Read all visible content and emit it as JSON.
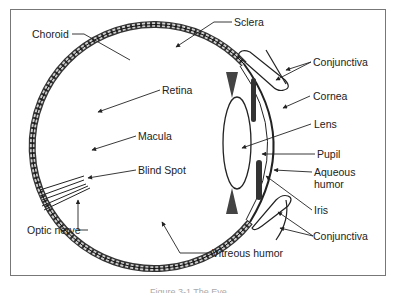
{
  "diagram": {
    "labels": {
      "choroid": "Choroid",
      "sclera": "Sclera",
      "retina": "Retina",
      "macula": "Macula",
      "blind_spot": "Blind Spot",
      "optic_nerve": "Optic nerve",
      "vitreous_humor": "Vitreous humor",
      "conjunctiva_top": "Conjunctiva",
      "cornea": "Cornea",
      "lens": "Lens",
      "pupil": "Pupil",
      "aqueous_humor_1": "Aqueous",
      "aqueous_humor_2": "humor",
      "iris": "Iris",
      "conjunctiva_bottom": "Conjunctiva"
    },
    "caption": "Figure 3-1 The Eye"
  }
}
